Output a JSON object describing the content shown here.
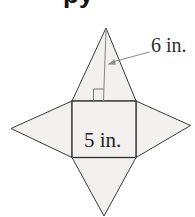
{
  "page": {
    "width_px": "195",
    "height_px": "217",
    "background": "#ffffff"
  },
  "cropped_heading": {
    "visible_fragment": "py"
  },
  "figure": {
    "slant_height_label": "6 in.",
    "square_label": "5 in.",
    "colors": {
      "face_fill": "#f2f1ee",
      "face_outline": "#3a3a3a",
      "square_outline": "#2e2e2e",
      "guide_gray": "#8d8d8d",
      "right_angle_gray": "#777777",
      "label_text": "#2f2f2f",
      "heading_text": "#111111"
    }
  }
}
